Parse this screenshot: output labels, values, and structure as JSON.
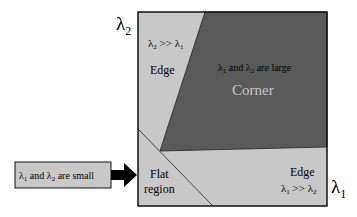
{
  "axes": {
    "y_label": "λ",
    "y_sub": "2",
    "x_label": "λ",
    "x_sub": "1"
  },
  "regions": {
    "edge_top": {
      "cond_a": "λ",
      "cond_a_sub": "2",
      "cond_op": " >> ",
      "cond_b": "λ",
      "cond_b_sub": "1",
      "label": "Edge"
    },
    "corner": {
      "cond_a": "λ",
      "cond_a_sub": "1",
      "cond_mid": " and ",
      "cond_b": "λ",
      "cond_b_sub": "2",
      "cond_tail": " are large",
      "label": "Corner"
    },
    "edge_right": {
      "label": "Edge",
      "cond_a": "λ",
      "cond_a_sub": "1",
      "cond_op": " >> ",
      "cond_b": "λ",
      "cond_b_sub": "2"
    },
    "flat": {
      "label_line1": "Flat",
      "label_line2": "region"
    }
  },
  "callout": {
    "a": "λ",
    "a_sub": "1",
    "mid": " and ",
    "b": "λ",
    "b_sub": "2",
    "tail": " are small"
  },
  "colors": {
    "light_region": "#c8c8c8",
    "dark_region": "#5a5a5a",
    "corner_label": "#c8c8c8",
    "border": "#111111",
    "callout_fill": "#c8c8c8",
    "arrow": "#000000"
  }
}
